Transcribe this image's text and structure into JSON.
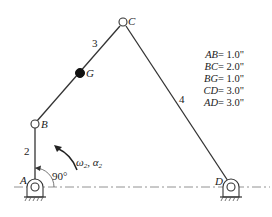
{
  "diagram": {
    "type": "four-bar-linkage",
    "joints": [
      {
        "id": "A",
        "label": "A",
        "ground": true
      },
      {
        "id": "B",
        "label": "B",
        "ground": false
      },
      {
        "id": "C",
        "label": "C",
        "ground": false
      },
      {
        "id": "D",
        "label": "D",
        "ground": true
      }
    ],
    "center_of_mass": {
      "id": "G",
      "label": "G"
    },
    "links": [
      {
        "id": "2",
        "label": "2",
        "from": "A",
        "to": "B"
      },
      {
        "id": "3",
        "label": "3",
        "from": "B",
        "to": "C"
      },
      {
        "id": "4",
        "label": "4",
        "from": "C",
        "to": "D"
      }
    ],
    "angle_label": "90°",
    "input_motion_label_omega": "ω",
    "input_motion_label_alpha": "α",
    "input_motion_subscript": "2",
    "input_motion_sep": ", ",
    "dimensions": [
      {
        "name": "AB",
        "eq": " = ",
        "value": "1.0\""
      },
      {
        "name": "BC",
        "eq": " = ",
        "value": "2.0\""
      },
      {
        "name": "BG",
        "eq": " = ",
        "value": "1.0\""
      },
      {
        "name": "CD",
        "eq": " = ",
        "value": "3.0\""
      },
      {
        "name": "AD",
        "eq": " = ",
        "value": "3.0\""
      }
    ]
  }
}
